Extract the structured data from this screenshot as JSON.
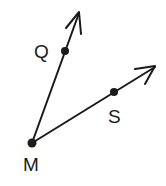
{
  "diagram": {
    "type": "angle",
    "vertex": {
      "label": "M",
      "x": 32,
      "y": 143
    },
    "rays": [
      {
        "name": "ray-MQ",
        "through": {
          "label": "Q",
          "x": 65,
          "y": 51
        },
        "tip": {
          "x": 79,
          "y": 12
        }
      },
      {
        "name": "ray-MS",
        "through": {
          "label": "S",
          "x": 114,
          "y": 97
        },
        "tip": {
          "x": 155,
          "y": 67
        }
      }
    ],
    "labels": {
      "q": "Q",
      "s": "S",
      "m": "M"
    },
    "colors": {
      "stroke": "#1a1a1a",
      "background": "#ffffff"
    }
  }
}
